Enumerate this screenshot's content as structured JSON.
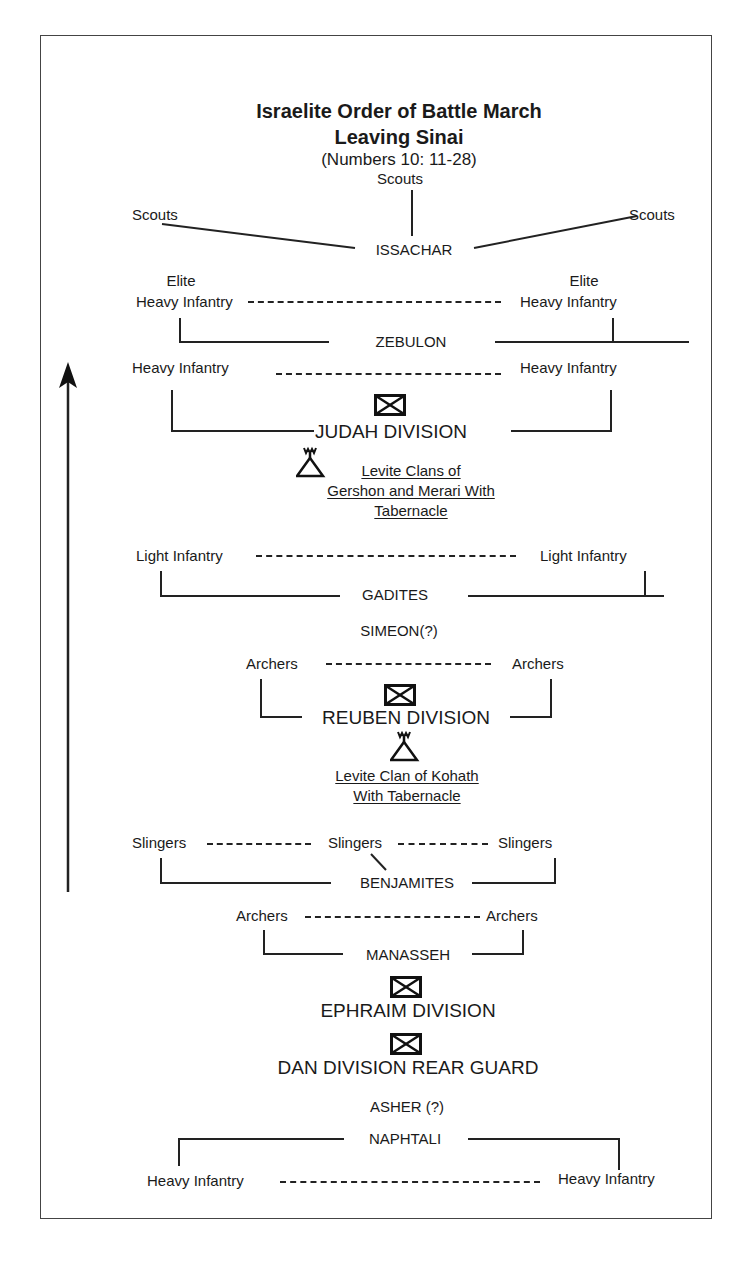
{
  "title": {
    "line1": "Israelite Order of Battle March",
    "line2": "Leaving Sinai",
    "reference": "(Numbers 10: 11-28)"
  },
  "direction_arrow": "march-direction-up",
  "formations": {
    "issachar": {
      "label": "ISSACHAR",
      "scouts_center": "Scouts",
      "scouts_left": "Scouts",
      "scouts_right": "Scouts"
    },
    "zebulon": {
      "label": "ZEBULON",
      "left_top": "Elite",
      "left_bottom": "Heavy Infantry",
      "right_top": "Elite",
      "right_bottom": "Heavy Infantry"
    },
    "judah": {
      "label": "JUDAH DIVISION",
      "left": "Heavy Infantry",
      "right": "Heavy Infantry",
      "symbol": "infantry-division-icon"
    },
    "levites_gershon_merari": {
      "line1": "Levite Clans of",
      "line2": "Gershon and Merari With",
      "line3": "Tabernacle",
      "symbol": "tabernacle-tent-icon"
    },
    "gadites": {
      "label": "GADITES",
      "left": "Light Infantry",
      "right": "Light Infantry"
    },
    "simeon": {
      "label": "SIMEON(?)"
    },
    "reuben": {
      "label": "REUBEN DIVISION",
      "left": "Archers",
      "right": "Archers",
      "symbol": "infantry-division-icon"
    },
    "levites_kohath": {
      "line1": "Levite Clan of Kohath",
      "line2": "With Tabernacle",
      "symbol": "tabernacle-tent-icon"
    },
    "benjamites": {
      "label": "BENJAMITES",
      "left": "Slingers",
      "center": "Slingers",
      "right": "Slingers"
    },
    "manasseh": {
      "label": "MANASSEH",
      "left": "Archers",
      "right": "Archers"
    },
    "ephraim": {
      "label": "EPHRAIM DIVISION",
      "symbol": "infantry-division-icon"
    },
    "dan": {
      "label": "DAN DIVISION REAR GUARD",
      "symbol": "infantry-division-icon"
    },
    "asher": {
      "label": "ASHER (?)"
    },
    "naphtali": {
      "label": "NAPHTALI",
      "left": "Heavy Infantry",
      "right": "Heavy Infantry"
    }
  }
}
